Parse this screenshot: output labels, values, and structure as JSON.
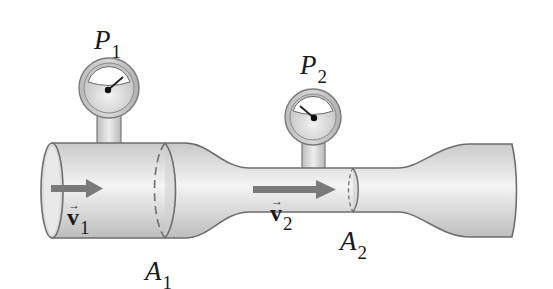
{
  "figure": {
    "colors": {
      "tube_fill_light": "#f2f2f2",
      "tube_fill_mid": "#d6d6d6",
      "tube_fill_dark": "#b4b4b4",
      "outline": "#6e6e6e",
      "arrow": "#7a7a7a",
      "gauge_face": "#ffffff",
      "needle": "#222222"
    }
  },
  "labels": {
    "p1": {
      "symbol": "P",
      "subscript": "1"
    },
    "p2": {
      "symbol": "P",
      "subscript": "2"
    },
    "a1": {
      "symbol": "A",
      "subscript": "1"
    },
    "a2": {
      "symbol": "A",
      "subscript": "2"
    },
    "v1": {
      "symbol": "v",
      "subscript": "1",
      "vector_mark": "→"
    },
    "v2": {
      "symbol": "v",
      "subscript": "2",
      "vector_mark": "→"
    }
  },
  "gauges": [
    {
      "id": "gauge-1",
      "label": "P1",
      "needle_direction": "upper-right"
    },
    {
      "id": "gauge-2",
      "label": "P2",
      "needle_direction": "upper-left"
    }
  ],
  "sections": [
    {
      "id": "wide-section",
      "area_label": "A1",
      "velocity_label": "v1"
    },
    {
      "id": "narrow-section",
      "area_label": "A2",
      "velocity_label": "v2"
    }
  ]
}
